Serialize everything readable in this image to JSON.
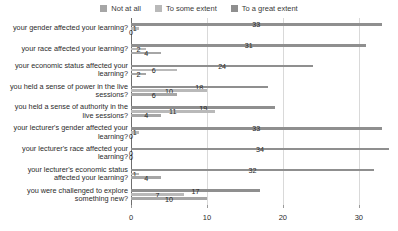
{
  "legend": {
    "position": "top-center",
    "items": [
      {
        "label": "Not at all",
        "color": "#a6a6a6"
      },
      {
        "label": "To some extent",
        "color": "#b9b9b9"
      },
      {
        "label": "To a great extent",
        "color": "#8f8f8f"
      }
    ]
  },
  "axis": {
    "xticks": [
      "0",
      "10",
      "20",
      "30"
    ],
    "xtick_values": [
      0,
      10,
      20,
      30
    ],
    "xmin": 0,
    "xmax": 34.5
  },
  "chart_data": {
    "type": "bar",
    "orientation": "horizontal",
    "title": "",
    "xlabel": "",
    "ylabel": "",
    "xlim": [
      0,
      34.5
    ],
    "grid": true,
    "legend_position": "top-center",
    "categories": [
      "your gender affected your learning?",
      "your race affected your learning?",
      "your economic status affected your learning?",
      "you held a sense of power in the live sessions?",
      "you held a sense of authority in the live sessions?",
      "your lecturer's gender affected your learning?",
      "your lecturer's race affected your learning?",
      "your lecturer's economic status affected your learning?",
      "you were challenged to explore something new?"
    ],
    "series": [
      {
        "name": "To a great extent",
        "color": "#8f8f8f",
        "values": [
          33,
          31,
          24,
          18,
          19,
          33,
          34,
          32,
          17
        ]
      },
      {
        "name": "To some extent",
        "color": "#b9b9b9",
        "values": [
          1,
          2,
          6,
          10,
          11,
          1,
          0,
          1,
          7
        ]
      },
      {
        "name": "Not at all",
        "color": "#a6a6a6",
        "values": [
          0,
          4,
          2,
          6,
          4,
          0,
          0,
          4,
          10
        ]
      }
    ]
  }
}
